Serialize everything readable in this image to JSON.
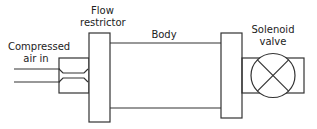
{
  "diagram": {
    "labels": {
      "inlet": [
        "Compressed",
        "air in"
      ],
      "restrictor": [
        "Flow",
        "restrictor"
      ],
      "body": "Body",
      "valve": [
        "Solenoid",
        "valve"
      ]
    },
    "colors": {
      "stroke": "#333333",
      "background": "#ffffff"
    }
  }
}
